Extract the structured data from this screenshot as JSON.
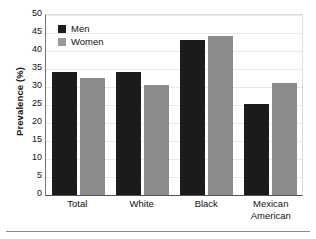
{
  "chart_data": {
    "type": "bar",
    "title": "",
    "subtitle": "",
    "xlabel": "",
    "ylabel": "Prevalence (%)",
    "categories": [
      "Total",
      "White",
      "Black",
      "Mexican American"
    ],
    "category_lines": [
      [
        "Total"
      ],
      [
        "White"
      ],
      [
        "Black"
      ],
      [
        "Mexican",
        "American"
      ]
    ],
    "series": [
      {
        "name": "Men",
        "color": "#1b1b1b",
        "values": [
          34.3,
          34.2,
          43.0,
          25.2
        ]
      },
      {
        "name": "Women",
        "color": "#8b8b8b",
        "values": [
          32.6,
          30.5,
          44.2,
          31.0
        ]
      }
    ],
    "ylim": [
      0,
      50
    ],
    "ytick_step": 5,
    "yticks": [
      50,
      45,
      40,
      35,
      30,
      25,
      20,
      15,
      10,
      5,
      0
    ],
    "grid": true,
    "grid_axis": "y",
    "legend_position": "top-left-inside",
    "legend_entries": [
      "Men",
      "Women"
    ]
  },
  "figure": {
    "background": "#ffffff",
    "axis_color": "#555555",
    "grid_color": "#e9e9e9",
    "bottom_rule_color": "#8a8a8a"
  }
}
